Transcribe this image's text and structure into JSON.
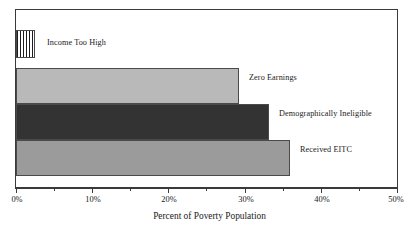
{
  "chart_data": {
    "type": "bar",
    "orientation": "horizontal",
    "title": "",
    "xlabel": "Percent of Poverty Population",
    "ylabel": "",
    "xlim": [
      0,
      50
    ],
    "xunit": "%",
    "grid": false,
    "legend": "none",
    "categories": [
      "Income Too High",
      "Zero Earnings",
      "Demographically Ineligible",
      "Received EITC"
    ],
    "values": [
      2.5,
      29.3,
      33.2,
      35.9
    ],
    "bar_colors": [
      "hatch-vertical-lines",
      "#b9b9b9",
      "#333333",
      "#9b9b9b"
    ],
    "x_tick_labels": [
      "0%",
      "10%",
      "20%",
      "30%",
      "40%",
      "50%"
    ],
    "x_tick_values": [
      0,
      10,
      20,
      30,
      40,
      50
    ],
    "x_minor_tick_values": [
      5,
      15,
      25,
      35,
      45
    ],
    "annotations": [
      {
        "text": "Income Too High",
        "value": 2.5
      },
      {
        "text": "Zero Earnings",
        "value": 29.3
      },
      {
        "text": "Demographically Ineligible",
        "value": 33.2
      },
      {
        "text": "Received EITC",
        "value": 35.9
      }
    ]
  },
  "colors": {
    "frame": "#3a3a3a",
    "bar_outline": "#4a4a4a",
    "bar_light_gray": "#b9b9b9",
    "bar_dark": "#333333",
    "bar_mid_gray": "#9b9b9b",
    "text": "#1a1a1a",
    "background": "#ffffff"
  }
}
